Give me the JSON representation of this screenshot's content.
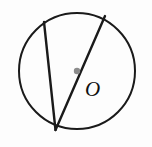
{
  "figure": {
    "background_color": "#fdfdfd",
    "stroke_color": "#1a1a1a",
    "center_dot_color": "#8c8c8c",
    "labels": {
      "center": "O"
    },
    "geometry": {
      "circle": {
        "cx": 77,
        "cy": 71,
        "r": 58,
        "stroke_width": 2.0
      },
      "center_point": {
        "x": 77,
        "y": 71,
        "radius": 3.2
      },
      "vertex": {
        "x": 55.5,
        "y": 130
      },
      "chords": [
        {
          "name": "chord-left",
          "from": {
            "x": 44,
            "y": 22
          },
          "to": {
            "x": 55.5,
            "y": 130
          },
          "stroke_width": 2.4,
          "through_center": false
        },
        {
          "name": "diameter-right",
          "from": {
            "x": 105,
            "y": 16
          },
          "to": {
            "x": 55.5,
            "y": 130
          },
          "stroke_width": 2.4,
          "through_center": true
        }
      ],
      "label_position": {
        "x": 85,
        "y": 96
      }
    }
  }
}
